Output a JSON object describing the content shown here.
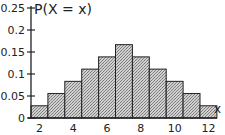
{
  "chart_data": {
    "type": "bar",
    "title": "",
    "xlabel": "x",
    "ylabel": "P(X = x)",
    "categories": [
      2,
      3,
      4,
      5,
      6,
      7,
      8,
      9,
      10,
      11,
      12
    ],
    "values": [
      0.0278,
      0.0556,
      0.0833,
      0.1111,
      0.1389,
      0.1667,
      0.1389,
      0.1111,
      0.0833,
      0.0556,
      0.0278
    ],
    "ylim": [
      0,
      0.25
    ],
    "yticks": [
      "0",
      "0.05",
      "0.1",
      "0.15",
      "0.2",
      "0.25"
    ],
    "xticks": [
      "2",
      "4",
      "6",
      "8",
      "10",
      "12"
    ],
    "grid": false,
    "legend": null,
    "bar_fill": "crosshatch gray",
    "bar_color": "#b8b8b8",
    "edge_color": "#222222"
  }
}
